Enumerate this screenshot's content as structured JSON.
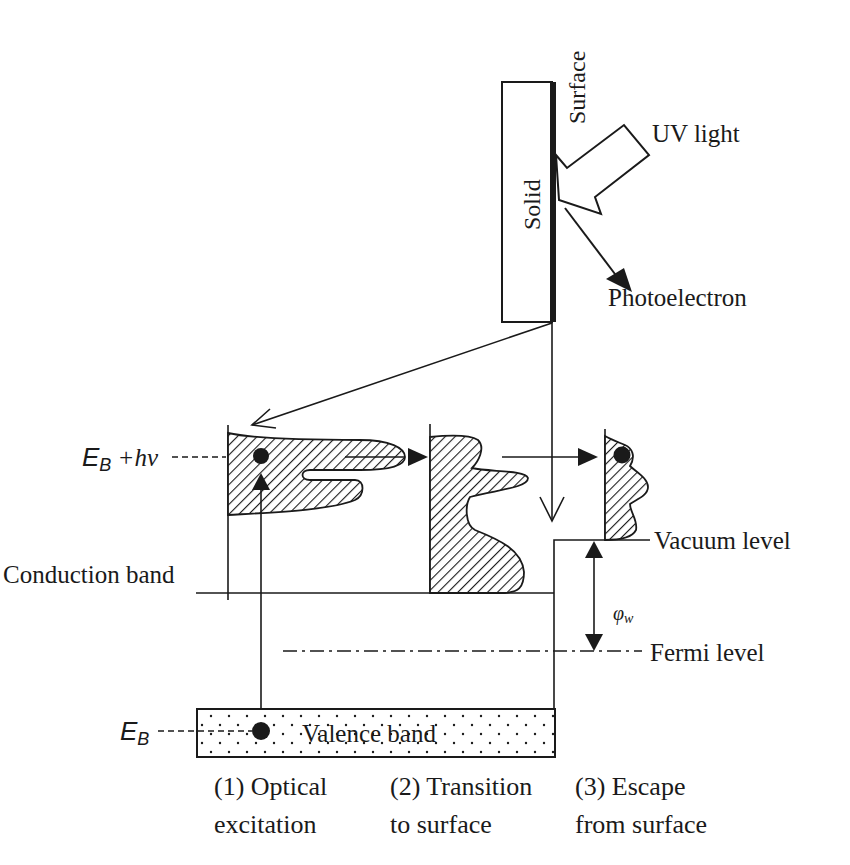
{
  "diagram": {
    "labels": {
      "surface": "Surface",
      "solid": "Solid",
      "uv_light": "UV light",
      "photoelectron": "Photoelectron",
      "eb_hv_main": "E",
      "eb_hv_sub": "B",
      "eb_hv_rest": " +hν",
      "eb_main": "E",
      "eb_sub": "B",
      "conduction_band": "Conduction band",
      "vacuum_level": "Vacuum level",
      "work_function_main": "φ",
      "work_function_sub": "w",
      "fermi_level": "Fermi level",
      "valence_band": "Valence band"
    },
    "steps": [
      {
        "line1": "(1) Optical",
        "line2": "excitation"
      },
      {
        "line1": "(2) Transition",
        "line2": "to surface"
      },
      {
        "line1": "(3) Escape",
        "line2": "from surface"
      }
    ],
    "colors": {
      "ink": "#1a1a1a",
      "background": "#ffffff"
    }
  }
}
